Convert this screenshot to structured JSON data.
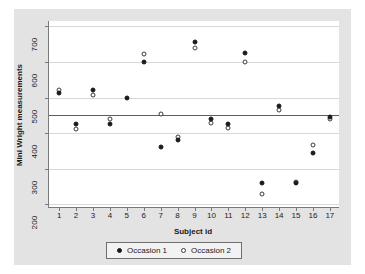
{
  "chart_data": {
    "type": "scatter",
    "title": "",
    "xlabel": "Subject id",
    "ylabel": "Mini Wright measurements",
    "xlim": [
      0.4,
      17.6
    ],
    "ylim": [
      190,
      715
    ],
    "yticks": [
      200,
      300,
      400,
      500,
      600,
      700
    ],
    "xticks": [
      1,
      2,
      3,
      4,
      5,
      6,
      7,
      8,
      9,
      10,
      11,
      12,
      13,
      14,
      15,
      16,
      17
    ],
    "grid": "horizontal",
    "legend_position": "bottom-center",
    "reference_line": {
      "orientation": "horizontal",
      "value": 450,
      "label": ""
    },
    "x": [
      1,
      2,
      3,
      4,
      5,
      6,
      7,
      8,
      9,
      10,
      11,
      12,
      13,
      14,
      15,
      16,
      17
    ],
    "series": [
      {
        "name": "Occasion 1",
        "marker": "filled-circle",
        "color": "#1a1a1a",
        "values": [
          512,
          425,
          520,
          425,
          500,
          600,
          360,
          380,
          656,
          440,
          425,
          624,
          260,
          475,
          261,
          345,
          445
        ]
      },
      {
        "name": "Occasion 2",
        "marker": "open-circle",
        "color": "#ffffff",
        "values": [
          522,
          412,
          508,
          440,
          null,
          622,
          455,
          390,
          640,
          428,
          416,
          600,
          228,
          466,
          264,
          367,
          440
        ]
      }
    ]
  },
  "axes": {
    "y_title": "Mini Wright measurements",
    "x_title": "Subject id",
    "y_tick_labels": [
      "200",
      "300",
      "400",
      "500",
      "600",
      "700"
    ],
    "x_tick_labels": [
      "1",
      "2",
      "3",
      "4",
      "5",
      "6",
      "7",
      "8",
      "9",
      "10",
      "11",
      "12",
      "13",
      "14",
      "15",
      "16",
      "17"
    ]
  },
  "legend": {
    "items": [
      {
        "label": "Occasion 1",
        "marker": "filled-circle"
      },
      {
        "label": "Occasion 2",
        "marker": "open-circle"
      }
    ]
  },
  "colors": {
    "page_background": "#ffffff",
    "figure_background": "#e3e3e3",
    "panel_background": "#ffffff",
    "gridline": "#d8d8d8",
    "axis": "#7a7a7a",
    "reference_line": "#5d5d5d",
    "text": "#1a1a1a",
    "legend_background": "#f2f2f2",
    "legend_border": "#6f6f6f"
  }
}
